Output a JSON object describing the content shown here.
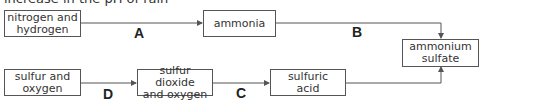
{
  "header": {
    "clipped_text": "increase in the pH of rain"
  },
  "nodes": {
    "n2h2": "nitrogen and\nhydrogen",
    "ammonia": "ammonia",
    "ammonium_sulfate": "ammonium\nsulfate",
    "s_o2": "sulfur and\noxygen",
    "so2": "sulfur dioxide\nand oxygen",
    "h2so4": "sulfuric\nacid"
  },
  "labels": {
    "A": "A",
    "B": "B",
    "C": "C",
    "D": "D"
  },
  "colors": {
    "line": "#555555",
    "text": "#333333"
  }
}
